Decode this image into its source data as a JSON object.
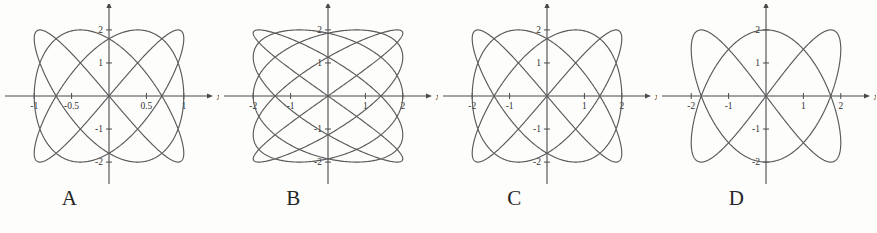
{
  "figure": {
    "background_color": "#fdfdfc",
    "curve_color": "#5a5a5a",
    "axis_color": "#4a4a4a",
    "panel_count": 4
  },
  "panels": [
    {
      "label": "A",
      "axis_label_x": "x",
      "axis_label_y": "y",
      "xticks": [
        "-1",
        "-0.5",
        "0.5",
        "1"
      ],
      "xtick_values": [
        -1,
        -0.5,
        0.5,
        1
      ],
      "yticks": [
        "2",
        "1",
        "-1",
        "-2"
      ],
      "ytick_values": [
        2,
        1,
        -1,
        -2
      ]
    },
    {
      "label": "B",
      "axis_label_x": "x",
      "axis_label_y": "y",
      "xticks": [
        "-2",
        "-1",
        "1",
        "2"
      ],
      "xtick_values": [
        -2,
        -1,
        1,
        2
      ],
      "yticks": [
        "2",
        "1",
        "-1",
        "-2"
      ],
      "ytick_values": [
        2,
        1,
        -1,
        -2
      ]
    },
    {
      "label": "C",
      "axis_label_x": "x",
      "axis_label_y": "y",
      "xticks": [
        "-2",
        "-1",
        "1",
        "2"
      ],
      "xtick_values": [
        -2,
        -1,
        1,
        2
      ],
      "yticks": [
        "2",
        "1",
        "-1",
        "-2"
      ],
      "ytick_values": [
        2,
        1,
        -1,
        -2
      ]
    },
    {
      "label": "D",
      "axis_label_x": "x",
      "axis_label_y": "y",
      "xticks": [
        "-2",
        "-1",
        "1",
        "2"
      ],
      "xtick_values": [
        -2,
        -1,
        1,
        2
      ],
      "yticks": [
        "2",
        "1",
        "-1",
        "-2"
      ],
      "ytick_values": [
        2,
        1,
        -1,
        -2
      ]
    }
  ],
  "chart_data": [
    {
      "type": "line",
      "title": "A",
      "xlabel": "x",
      "ylabel": "y",
      "grid": false,
      "legend": "none",
      "xlim": [
        -1.15,
        1.15
      ],
      "ylim": [
        -2.3,
        2.3
      ],
      "xticks": [
        -1,
        -0.5,
        0.5,
        1
      ],
      "xticklabels": [
        "-1",
        "-0.5",
        "0.5",
        "1"
      ],
      "yticks": [
        2,
        1,
        -1,
        -2
      ],
      "yticklabels": [
        "2",
        "1",
        "-1",
        "-2"
      ],
      "parametric": {
        "x": "1.0*sin(3*t)",
        "y": "2.0*sin(4*t)",
        "amplitude_x": 1.0,
        "amplitude_y": 2.0,
        "freq_x": 3,
        "freq_y": 4,
        "phase": 0,
        "t_range": [
          0,
          6.283185307179586
        ]
      }
    },
    {
      "type": "line",
      "title": "B",
      "xlabel": "x",
      "ylabel": "y",
      "grid": false,
      "legend": "none",
      "xlim": [
        -2.3,
        2.3
      ],
      "ylim": [
        -2.3,
        2.3
      ],
      "xticks": [
        -2,
        -1,
        1,
        2
      ],
      "xticklabels": [
        "-2",
        "-1",
        "1",
        "2"
      ],
      "yticks": [
        2,
        1,
        -1,
        -2
      ],
      "yticklabels": [
        "2",
        "1",
        "-1",
        "-2"
      ],
      "parametric": {
        "x": "2.0*sin(5*t)",
        "y": "2.0*sin(4*t)",
        "amplitude_x": 2.0,
        "amplitude_y": 2.0,
        "freq_x": 5,
        "freq_y": 4,
        "phase": 0,
        "t_range": [
          0,
          6.283185307179586
        ]
      }
    },
    {
      "type": "line",
      "title": "C",
      "xlabel": "x",
      "ylabel": "y",
      "grid": false,
      "legend": "none",
      "xlim": [
        -2.3,
        2.3
      ],
      "ylim": [
        -2.3,
        2.3
      ],
      "xticks": [
        -2,
        -1,
        1,
        2
      ],
      "xticklabels": [
        "-2",
        "-1",
        "1",
        "2"
      ],
      "yticks": [
        2,
        1,
        -1,
        -2
      ],
      "yticklabels": [
        "2",
        "1",
        "-1",
        "-2"
      ],
      "parametric": {
        "x": "2.0*sin(3*t)",
        "y": "2.0*sin(4*t)",
        "amplitude_x": 2.0,
        "amplitude_y": 2.0,
        "freq_x": 3,
        "freq_y": 4,
        "phase": 0,
        "t_range": [
          0,
          6.283185307179586
        ]
      }
    },
    {
      "type": "line",
      "title": "D",
      "xlabel": "x",
      "ylabel": "y",
      "grid": false,
      "legend": "none",
      "xlim": [
        -2.3,
        2.3
      ],
      "ylim": [
        -2.3,
        2.3
      ],
      "xticks": [
        -2,
        -1,
        1,
        2
      ],
      "xticklabels": [
        "-2",
        "-1",
        "1",
        "2"
      ],
      "yticks": [
        2,
        1,
        -1,
        -2
      ],
      "yticklabels": [
        "2",
        "1",
        "-1",
        "-2"
      ],
      "parametric": {
        "x": "2.0*sin(2*t)",
        "y": "2.0*sin(3*t)",
        "amplitude_x": 2.0,
        "amplitude_y": 2.0,
        "freq_x": 2,
        "freq_y": 3,
        "phase": 0,
        "t_range": [
          0,
          6.283185307179586
        ]
      }
    }
  ]
}
